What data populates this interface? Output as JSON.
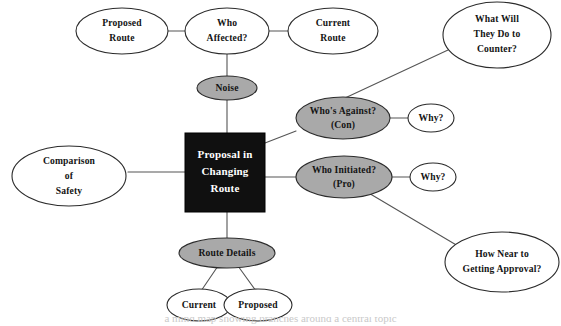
{
  "figure": {
    "type": "mind-map",
    "title_text": "Proposal in Changing Route",
    "background_color": "#ffffff",
    "caption_partial": "a mind map showing branches around a central topic"
  },
  "colors": {
    "center_fill": "#101010",
    "center_text": "#ffffff",
    "primary_branch_fill": "#a9a9a9",
    "sub_branch_fill": "#ffffff",
    "outline": "#2b2b2b",
    "edge": "#555555"
  },
  "center": {
    "name": "central-topic",
    "line1": "Proposal in",
    "line2": "Changing",
    "line3": "Route"
  },
  "nodes": {
    "noise": {
      "line1": "Noise",
      "fill": "gray"
    },
    "who_affected": {
      "line1": "Who",
      "line2": "Affected?",
      "fill": "white"
    },
    "proposed_route": {
      "line1": "Proposed",
      "line2": "Route",
      "fill": "white"
    },
    "current_route": {
      "line1": "Current",
      "line2": "Route",
      "fill": "white"
    },
    "whos_against": {
      "line1": "Who's Against?",
      "line2": "(Con)",
      "fill": "gray"
    },
    "who_initiated": {
      "line1": "Who Initiated?",
      "line2": "(Pro)",
      "fill": "gray"
    },
    "why_con": {
      "line1": "Why?",
      "fill": "white"
    },
    "why_pro": {
      "line1": "Why?",
      "fill": "white"
    },
    "what_will_they_do": {
      "line1": "What Will",
      "line2": "They Do to",
      "line3": "Counter?",
      "fill": "white"
    },
    "how_near_approval": {
      "line1": "How Near to",
      "line2": "Getting Approval?",
      "fill": "white"
    },
    "comparison_safety": {
      "line1": "Comparison",
      "line2": "of",
      "line3": "Safety",
      "fill": "white"
    },
    "route_details": {
      "line1": "Route Details",
      "fill": "gray"
    },
    "route_current": {
      "line1": "Current",
      "fill": "white"
    },
    "route_proposed": {
      "line1": "Proposed",
      "fill": "white"
    }
  }
}
